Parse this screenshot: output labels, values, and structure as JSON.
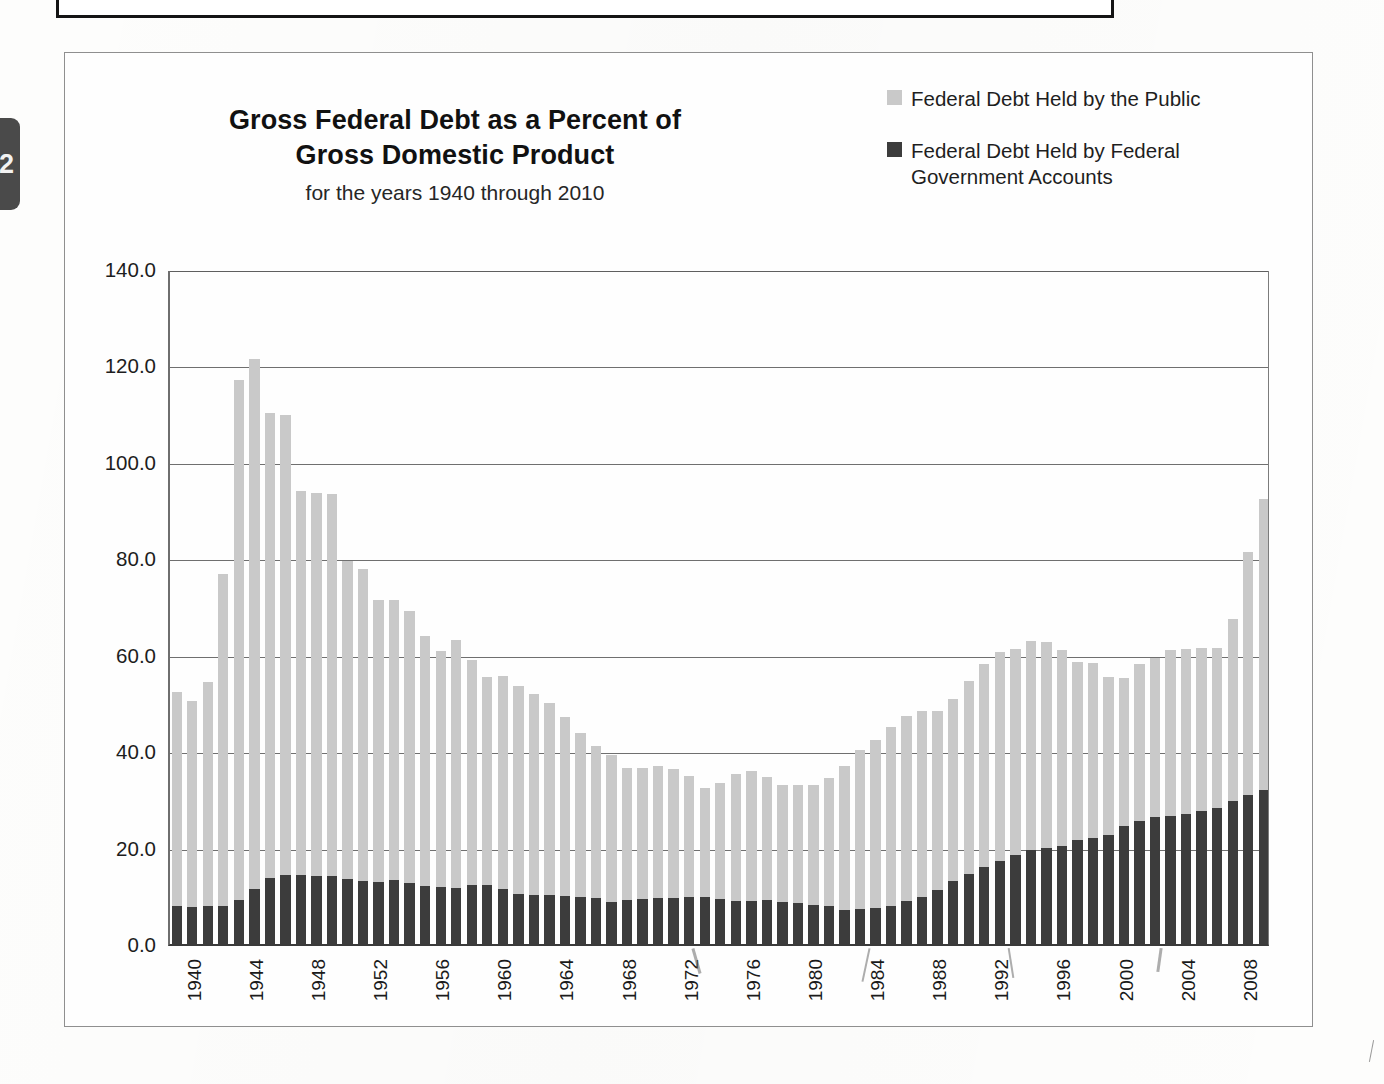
{
  "sidebar": {
    "tab_label": "2"
  },
  "header": {
    "title_line1": "Gross  Federal Debt as a Percent of",
    "title_line2": "Gross Domestic Product",
    "subtitle": "for the years 1940 through 2010"
  },
  "legend": {
    "position": "top-right",
    "items": [
      {
        "label": "Federal Debt Held by the Public",
        "color": "#c9c9c9",
        "icon": "legend-swatch-light"
      },
      {
        "label": "Federal Debt Held by Federal Government Accounts",
        "label_line1": "Federal Debt Held by Federal",
        "label_line2": "Government Accounts",
        "color": "#3c3c3c",
        "icon": "legend-swatch-dark"
      }
    ]
  },
  "axes": {
    "y_ticks": [
      "140.0",
      "120.0",
      "100.0",
      "80.0",
      "60.0",
      "40.0",
      "20.0",
      "0.0"
    ],
    "x_ticks": [
      "1940",
      "1944",
      "1948",
      "1952",
      "1956",
      "1960",
      "1964",
      "1968",
      "1972",
      "1976",
      "1980",
      "1984",
      "1988",
      "1992",
      "1996",
      "2000",
      "2004",
      "2008"
    ]
  },
  "chart_data": {
    "type": "bar",
    "stacked": true,
    "title": "Gross  Federal Debt as a Percent of Gross Domestic Product",
    "subtitle": "for the years 1940 through 2010",
    "xlabel": "",
    "ylabel": "",
    "ylim": [
      0,
      140
    ],
    "ytick_step": 20,
    "grid": true,
    "legend_position": "top-right",
    "categories": [
      1940,
      1941,
      1942,
      1943,
      1944,
      1945,
      1946,
      1947,
      1948,
      1949,
      1950,
      1951,
      1952,
      1953,
      1954,
      1955,
      1956,
      1957,
      1958,
      1959,
      1960,
      1961,
      1962,
      1963,
      1964,
      1965,
      1966,
      1967,
      1968,
      1969,
      1970,
      1971,
      1972,
      1973,
      1974,
      1975,
      1976,
      1977,
      1978,
      1979,
      1980,
      1981,
      1982,
      1983,
      1984,
      1985,
      1986,
      1987,
      1988,
      1989,
      1990,
      1991,
      1992,
      1993,
      1994,
      1995,
      1996,
      1997,
      1998,
      1999,
      2000,
      2001,
      2002,
      2003,
      2004,
      2005,
      2006,
      2007,
      2008,
      2009,
      2010
    ],
    "series": [
      {
        "name": "Federal Debt Held by Federal Government Accounts",
        "color": "#3c3c3c",
        "values": [
          8.4,
          8.0,
          8.3,
          8.2,
          9.6,
          11.8,
          14.1,
          14.8,
          14.7,
          14.6,
          14.6,
          13.8,
          13.5,
          13.3,
          13.6,
          13.0,
          12.5,
          12.2,
          12.0,
          12.6,
          12.7,
          11.8,
          10.8,
          10.5,
          10.6,
          10.3,
          10.2,
          9.9,
          9.2,
          9.6,
          9.8,
          9.9,
          10.0,
          10.2,
          10.2,
          9.8,
          9.3,
          9.4,
          9.5,
          9.2,
          8.9,
          8.5,
          8.2,
          7.5,
          7.6,
          7.9,
          8.4,
          9.3,
          10.2,
          11.7,
          13.4,
          14.9,
          16.3,
          17.6,
          18.8,
          19.9,
          20.3,
          20.8,
          21.9,
          22.5,
          23.1,
          24.8,
          26.0,
          26.7,
          27.0,
          27.4,
          28.0,
          28.6,
          30.0,
          31.4,
          32.3
        ]
      },
      {
        "name": "Federal Debt Held by the Public",
        "color": "#c9c9c9",
        "values": [
          44.2,
          42.8,
          46.5,
          69.0,
          107.8,
          110.0,
          96.5,
          95.4,
          79.6,
          79.4,
          79.2,
          66.0,
          64.8,
          58.5,
          58.1,
          56.5,
          51.7,
          48.9,
          51.4,
          46.8,
          43.1,
          44.3,
          43.2,
          41.7,
          39.9,
          37.1,
          33.9,
          31.6,
          30.5,
          27.4,
          27.2,
          27.5,
          26.7,
          25.0,
          22.6,
          24.0,
          26.3,
          26.8,
          25.5,
          24.2,
          24.5,
          24.9,
          26.6,
          29.8,
          33.0,
          34.8,
          37.0,
          38.4,
          38.5,
          37.1,
          37.8,
          40.1,
          42.2,
          43.4,
          42.7,
          43.3,
          42.8,
          40.6,
          37.1,
          36.3,
          32.7,
          30.8,
          32.4,
          33.0,
          34.4,
          34.2,
          33.9,
          33.3,
          37.8,
          50.4,
          60.5
        ]
      }
    ],
    "totals": [
      52.6,
      50.8,
      54.8,
      77.2,
      117.4,
      121.8,
      110.6,
      110.2,
      94.3,
      94.0,
      93.8,
      79.8,
      78.3,
      71.8,
      71.7,
      69.5,
      64.2,
      61.1,
      63.4,
      59.4,
      55.8,
      56.1,
      54.0,
      52.2,
      50.5,
      47.4,
      44.1,
      41.5,
      39.7,
      37.0,
      37.0,
      37.4,
      36.7,
      35.2,
      32.8,
      33.8,
      35.6,
      36.2,
      35.0,
      33.4,
      33.4,
      33.4,
      34.8,
      37.3,
      40.6,
      42.7,
      45.4,
      47.7,
      48.7,
      48.8,
      51.2,
      55.0,
      58.5,
      61.0,
      61.5,
      63.2,
      63.1,
      61.4,
      59.0,
      58.8,
      55.8,
      55.6,
      58.4,
      59.7,
      61.4,
      61.6,
      61.9,
      61.9,
      67.8,
      81.8,
      92.8
    ]
  }
}
